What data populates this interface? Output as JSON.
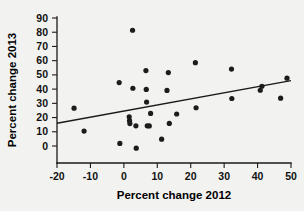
{
  "chart_data": {
    "type": "scatter",
    "title": "",
    "subtitle": "",
    "xlabel": "Percent change 2012",
    "ylabel": "Percent change 2013",
    "xlim": [
      -20,
      50
    ],
    "ylim": [
      0,
      90
    ],
    "x_ticks": [
      -20,
      -10,
      0,
      10,
      20,
      30,
      40,
      50
    ],
    "x_tick_labels": [
      "-20",
      "-10",
      "0",
      "10",
      "20",
      "30",
      "40",
      "50"
    ],
    "y_ticks": [
      0,
      10,
      20,
      30,
      40,
      50,
      60,
      70,
      80,
      90
    ],
    "y_tick_labels": [
      "0",
      "10",
      "20",
      "30",
      "40",
      "50",
      "60",
      "70",
      "80",
      "90"
    ],
    "grid": false,
    "legend": null,
    "legend_position": "none",
    "point_color": "#1c1c1c",
    "point_radius": 2.6,
    "line_color": "#1a1a1a",
    "points": [
      {
        "x": -14.9,
        "y": 26.6
      },
      {
        "x": -11.9,
        "y": 10.5
      },
      {
        "x": -1.4,
        "y": 44.6
      },
      {
        "x": -1.2,
        "y": 1.8
      },
      {
        "x": 1.6,
        "y": 20.5
      },
      {
        "x": 1.7,
        "y": 17.8
      },
      {
        "x": 1.8,
        "y": 15.8
      },
      {
        "x": 2.6,
        "y": 81.4
      },
      {
        "x": 2.7,
        "y": 40.6
      },
      {
        "x": 3.6,
        "y": 14.2
      },
      {
        "x": 3.7,
        "y": -1.5
      },
      {
        "x": 6.6,
        "y": 53.0
      },
      {
        "x": 6.7,
        "y": 39.8
      },
      {
        "x": 6.8,
        "y": 30.9
      },
      {
        "x": 7.0,
        "y": 14.2
      },
      {
        "x": 7.6,
        "y": 14.1
      },
      {
        "x": 8.0,
        "y": 22.9
      },
      {
        "x": 11.3,
        "y": 4.8
      },
      {
        "x": 12.9,
        "y": 39.1
      },
      {
        "x": 13.3,
        "y": 51.6
      },
      {
        "x": 13.6,
        "y": 15.9
      },
      {
        "x": 15.8,
        "y": 22.5
      },
      {
        "x": 21.4,
        "y": 58.6
      },
      {
        "x": 21.6,
        "y": 26.9
      },
      {
        "x": 32.2,
        "y": 54.1
      },
      {
        "x": 32.3,
        "y": 33.4
      },
      {
        "x": 40.8,
        "y": 39.2
      },
      {
        "x": 41.3,
        "y": 42.0
      },
      {
        "x": 46.9,
        "y": 33.6
      },
      {
        "x": 48.8,
        "y": 47.7
      }
    ],
    "trend_line": {
      "x_start": -20,
      "y_start": 16.0,
      "x_end": 50,
      "y_end": 46.0
    }
  }
}
